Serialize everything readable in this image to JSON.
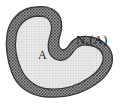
{
  "figure": {
    "background_color": "#ffffff",
    "width": 126,
    "height": 106
  },
  "labels": {
    "set": {
      "text": "A",
      "color": "#1a1a1a"
    },
    "neighborhood": {
      "base": "N",
      "subscript": "ε",
      "argument": "(A)",
      "full_text": "Nε(A)",
      "color": "#1a1a1a"
    }
  },
  "regions": {
    "inner_set": {
      "name": "A",
      "fill_color": "#eeeeee",
      "dot_color": "#b9b9b9",
      "texture": "fine-dot-grid"
    },
    "neighborhood_band": {
      "name": "Nε(A)",
      "fill_color": "#9a9a9a",
      "dot_color": "#4a4a4a",
      "texture": "coarse-dot-grid"
    },
    "outline": {
      "stroke_color": "#3a3a3a",
      "stroke_width": 1.4
    }
  },
  "geometry": {
    "outer_boundary_path": "M 36,7 C 20,8 9,20 7,35 C 5,49 8,62 12,73 C 17,86 29,96 47,97 C 66,98 83,93 96,84 C 108,76 114,65 112,55 C 110,45 101,39 91,37 C 82,35 74,38 70,44 C 67,49 64,51 61,49 C 58,47 58,42 60,35 C 63,26 62,16 55,11 C 50,7 43,6 36,7 Z",
    "inner_boundary_path": "M 37,16 C 25,17 17,26 16,37 C 14,49 17,60 21,69 C 26,80 36,88 49,89 C 65,90 79,85 90,77 C 99,71 104,63 103,56 C 102,49 95,46 88,45 C 81,44 76,47 73,52 C 68,60 61,62 55,59 C 48,55 47,46 50,36 C 53,27 51,20 45,17 C 43,16 40,16 37,16 Z"
  }
}
